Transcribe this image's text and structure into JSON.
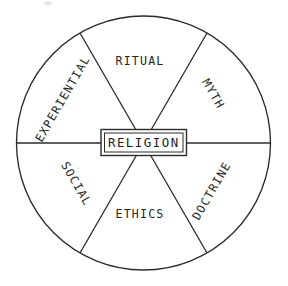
{
  "diagram": {
    "type": "sectored-circle",
    "center": {
      "label": "RELIGION",
      "shape": "double-bordered-rectangle"
    },
    "geometry": {
      "circle_center_x": 143.5,
      "circle_center_y": 143,
      "circle_radius": 127,
      "sector_count": 6,
      "sector_span_degrees": 60,
      "stroke_color": "#2b2b2b",
      "background_color": "#ffffff"
    },
    "sectors": [
      {
        "id": "ritual",
        "label": "RITUAL",
        "position": "top",
        "mid_angle_degrees": 90,
        "text_rotation_degrees": 0,
        "label_x": 140,
        "label_y": 61
      },
      {
        "id": "myth",
        "label": "MYTH",
        "position": "upper-right",
        "mid_angle_degrees": 30,
        "text_rotation_degrees": 60,
        "label_x": 213,
        "label_y": 94
      },
      {
        "id": "doctrine",
        "label": "DOCTRINE",
        "position": "lower-right",
        "mid_angle_degrees": 330,
        "text_rotation_degrees": -60,
        "label_x": 212,
        "label_y": 191
      },
      {
        "id": "ethics",
        "label": "ETHICS",
        "position": "bottom",
        "mid_angle_degrees": 270,
        "text_rotation_degrees": 0,
        "label_x": 140,
        "label_y": 214
      },
      {
        "id": "social",
        "label": "SOCIAL",
        "position": "lower-left",
        "mid_angle_degrees": 210,
        "text_rotation_degrees": 60,
        "label_x": 76,
        "label_y": 184
      },
      {
        "id": "experiential",
        "label": "EXPERIENTIAL",
        "position": "upper-left",
        "mid_angle_degrees": 150,
        "text_rotation_degrees": -60,
        "label_x": 63,
        "label_y": 99
      }
    ]
  }
}
